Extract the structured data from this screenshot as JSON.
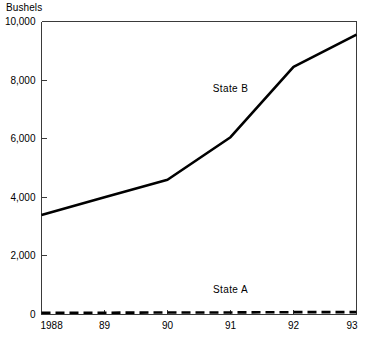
{
  "chart_data": {
    "type": "line",
    "title": "",
    "subtitle": "",
    "xlabel": "",
    "ylabel": "Bushels",
    "x": [
      1988,
      1989,
      1990,
      1991,
      1992,
      1993
    ],
    "xtick_labels": [
      "1988",
      "89",
      "90",
      "91",
      "92",
      "93"
    ],
    "ytick_labels": [
      "0",
      "2,000",
      "4,000",
      "6,000",
      "8,000",
      "10,000"
    ],
    "ytick_values": [
      0,
      2000,
      4000,
      6000,
      8000,
      10000
    ],
    "ylim": [
      0,
      10000
    ],
    "xlim": [
      1988,
      1993
    ],
    "grid": false,
    "legend_position": "inline-annotations",
    "series": [
      {
        "name": "State B",
        "values": [
          3400,
          4000,
          4600,
          6050,
          8450,
          9550
        ],
        "style": "solid",
        "color": "#000000",
        "label_x": 1991,
        "label_y": 7600
      },
      {
        "name": "State A",
        "values": [
          60,
          60,
          70,
          70,
          80,
          80
        ],
        "style": "dashed",
        "color": "#000000",
        "label_x": 1991,
        "label_y": 750
      }
    ]
  },
  "axes": {
    "unit_label": "Bushels",
    "frame_color": "#3a3a3a"
  },
  "annotations": {
    "state_b_label": "State B",
    "state_a_label": "State A"
  }
}
